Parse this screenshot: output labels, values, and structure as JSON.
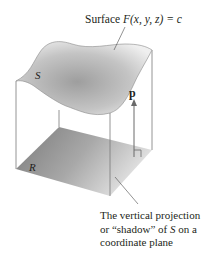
{
  "diagram": {
    "surface_label": {
      "prefix": "Surface ",
      "func": "F",
      "args": "(x, y, z)",
      "rhs": " = c"
    },
    "surface_name": "S",
    "region_name": "R",
    "vector_name": "p",
    "caption": {
      "line1": "The vertical projection",
      "line2_pre": "or “shadow” of ",
      "line2_var": "S",
      "line2_post": " on a",
      "line3": "coordinate plane"
    },
    "colors": {
      "surface_light": "#f2f2f2",
      "surface_dark": "#9a9a9a",
      "region_dark": "#7f7f7f",
      "region_light": "#d4d4d4",
      "edge": "#6d6d6d",
      "text": "#231f20"
    }
  }
}
